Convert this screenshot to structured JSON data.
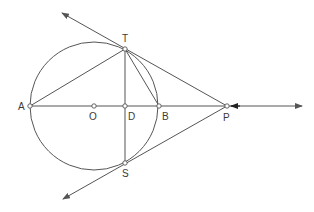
{
  "diagram": {
    "title": "",
    "colors": {
      "stroke": "#555555",
      "label": "#3a3a3a",
      "background": "#ffffff"
    },
    "circle": {
      "center": "O",
      "cx": 94,
      "cy": 106,
      "r": 64
    },
    "points": [
      {
        "id": "A",
        "label": "A",
        "x": 30,
        "y": 106,
        "lx": 18,
        "ly": 110
      },
      {
        "id": "O",
        "label": "O",
        "x": 94,
        "y": 106,
        "lx": 89,
        "ly": 120
      },
      {
        "id": "D",
        "label": "D",
        "x": 125,
        "y": 106,
        "lx": 128,
        "ly": 120
      },
      {
        "id": "B",
        "label": "B",
        "x": 159,
        "y": 106,
        "lx": 162,
        "ly": 120
      },
      {
        "id": "P",
        "label": "P",
        "x": 227,
        "y": 106,
        "lx": 223,
        "ly": 121
      },
      {
        "id": "T",
        "label": "T",
        "x": 125,
        "y": 49,
        "lx": 122,
        "ly": 42
      },
      {
        "id": "S",
        "label": "S",
        "x": 125,
        "y": 163,
        "lx": 122,
        "ly": 177
      }
    ],
    "segments": [
      {
        "name": "segment-AT",
        "from": "A",
        "to": "T"
      },
      {
        "name": "segment-TD",
        "from": "T",
        "to": "S"
      },
      {
        "name": "segment-TB",
        "from": "T",
        "to": "B"
      }
    ],
    "rays": [
      {
        "name": "tangent-PT",
        "x1": 227,
        "y1": 106,
        "x2": 62,
        "y2": 13
      },
      {
        "name": "tangent-PS",
        "x1": 227,
        "y1": 106,
        "x2": 63,
        "y2": 199
      },
      {
        "name": "line-AP",
        "x1": 30,
        "y1": 106,
        "x2": 302,
        "y2": 106
      }
    ],
    "extra_arrow": {
      "name": "arrow-toward-P",
      "x1": 240,
      "y1": 106,
      "x2": 231,
      "y2": 106
    }
  }
}
